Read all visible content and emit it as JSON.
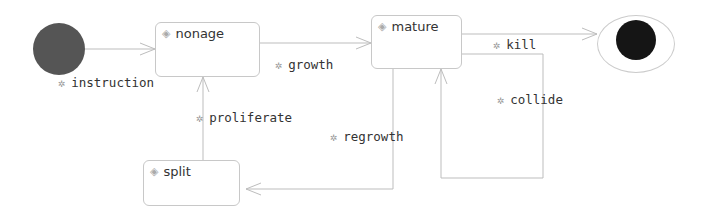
{
  "diagram": {
    "type": "state-machine",
    "initial_state": "initial",
    "final_state": "final",
    "states": [
      {
        "id": "nonage",
        "label": "nonage",
        "icon": "state-diamond-icon"
      },
      {
        "id": "mature",
        "label": "mature",
        "icon": "state-diamond-icon"
      },
      {
        "id": "split",
        "label": "split",
        "icon": "state-diamond-icon"
      }
    ],
    "transitions": [
      {
        "from": "initial",
        "to": "nonage",
        "label": "instruction",
        "icon": "event-gear-icon"
      },
      {
        "from": "nonage",
        "to": "mature",
        "label": "growth",
        "icon": "event-gear-icon"
      },
      {
        "from": "mature",
        "to": "final",
        "label": "kill",
        "icon": "event-gear-icon"
      },
      {
        "from": "mature",
        "to": "mature",
        "label": "collide",
        "icon": "event-gear-icon"
      },
      {
        "from": "mature",
        "to": "split",
        "label": "regrowth",
        "icon": "event-gear-icon"
      },
      {
        "from": "split",
        "to": "nonage",
        "label": "proliferate",
        "icon": "event-gear-icon"
      }
    ]
  },
  "colors": {
    "initial_fill": "#555555",
    "final_fill": "#151515",
    "line": "#bbbbbb",
    "state_border": "#c8c8c8"
  }
}
